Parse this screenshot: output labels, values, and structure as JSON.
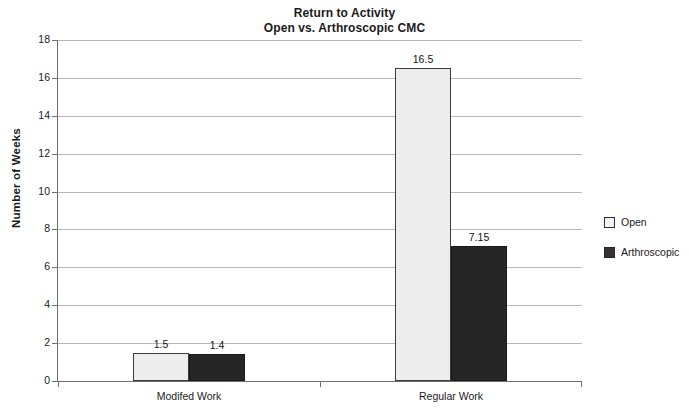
{
  "chart_data": {
    "type": "bar",
    "title": "Return to Activity",
    "subtitle": "Open vs. Arthroscopic CMC",
    "title_lines": [
      "Return to Activity",
      "Open vs. Arthroscopic CMC"
    ],
    "xlabel": "",
    "ylabel": "Number of Weeks",
    "ylim": [
      0,
      18
    ],
    "ytick_step": 2,
    "yticks": [
      "18",
      "16",
      "14",
      "12",
      "10",
      "8",
      "6",
      "4",
      "2",
      "0"
    ],
    "grid": true,
    "legend_position": "right",
    "categories": [
      "Modifed Work",
      "Regular Work"
    ],
    "series": [
      {
        "name": "Open",
        "color": "#ededed",
        "border_color": "#3b3b3b",
        "values": [
          1.5,
          16.5
        ],
        "value_labels": [
          "1.5",
          "16.5"
        ]
      },
      {
        "name": "Arthroscopic",
        "color": "#262626",
        "border_color": "#1a1a1a",
        "values": [
          1.4,
          7.15
        ],
        "value_labels": [
          "1.4",
          "7.15"
        ]
      }
    ]
  },
  "legend": {
    "items": [
      {
        "label": "Open"
      },
      {
        "label": "Arthroscopic"
      }
    ]
  }
}
